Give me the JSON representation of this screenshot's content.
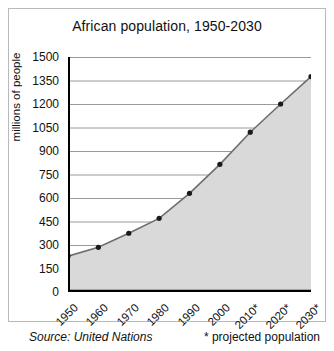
{
  "chart_data": {
    "type": "area",
    "title": "African population, 1950-2030",
    "xlabel": "",
    "ylabel": "millions of people",
    "categories": [
      "1950",
      "1960",
      "1970",
      "1980",
      "1990",
      "2000",
      "2010*",
      "2020*",
      "2030*"
    ],
    "values": [
      229,
      285,
      375,
      470,
      630,
      815,
      1020,
      1200,
      1375
    ],
    "series": [
      {
        "name": "African population",
        "values": [
          229,
          285,
          375,
          470,
          630,
          815,
          1020,
          1200,
          1375
        ]
      }
    ],
    "ylim": [
      0,
      1500
    ],
    "y_ticks": [
      0,
      150,
      300,
      450,
      600,
      750,
      900,
      1050,
      1200,
      1350,
      1500
    ],
    "y_tick_labels": [
      "0",
      "150",
      "300",
      "450",
      "600",
      "750",
      "900",
      "1050",
      "1200",
      "1350",
      "1500"
    ],
    "grid": true,
    "grid_axis": "y",
    "legend": false,
    "legend_position": "none",
    "marker": "circle",
    "fill_color": "#d9d9d9",
    "line_color": "#6e6e6e",
    "marker_color": "#1a1a1a",
    "grid_color": "#9a9a9a",
    "axis_color": "#000000",
    "background_color": "#ffffff"
  },
  "footer": {
    "source": "Source: United Nations",
    "projection_note": "* projected population"
  }
}
